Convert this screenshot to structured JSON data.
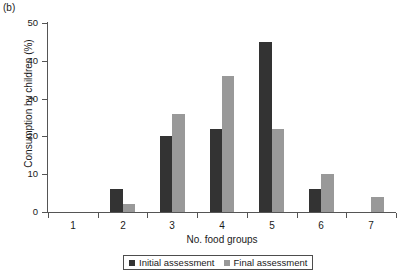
{
  "panel_label": "(b)",
  "chart_data": {
    "type": "bar",
    "title": "",
    "xlabel": "No. food groups",
    "ylabel": "Consumption by children (%)",
    "categories": [
      "1",
      "2",
      "3",
      "4",
      "5",
      "6",
      "7"
    ],
    "series": [
      {
        "name": "Initial assessment",
        "color": "#333333",
        "values": [
          0,
          6,
          20,
          22,
          45,
          6,
          0
        ]
      },
      {
        "name": "Final assessment",
        "color": "#999999",
        "values": [
          0,
          2,
          26,
          36,
          22,
          10,
          4
        ]
      }
    ],
    "ylim": [
      0,
      50
    ],
    "yticks": [
      0,
      10,
      20,
      30,
      40,
      50
    ],
    "ytick_labels": [
      "0",
      "10",
      "20",
      "30",
      "40",
      "50"
    ],
    "grid": false,
    "legend_position": "bottom"
  },
  "legend": {
    "entries": [
      {
        "label": "Initial assessment",
        "color": "#333333"
      },
      {
        "label": "Final assessment",
        "color": "#999999"
      }
    ]
  }
}
